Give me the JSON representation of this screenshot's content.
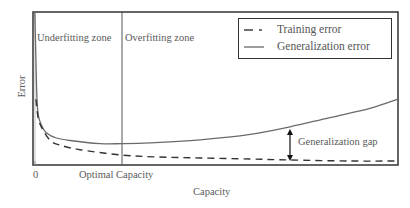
{
  "chart_data": {
    "type": "line",
    "title": "",
    "xlabel": "Capacity",
    "ylabel": "Error",
    "x_ticks": [
      {
        "label": "0",
        "x": 0
      },
      {
        "label": "Optimal Capacity",
        "x": 24.4
      }
    ],
    "xlim": [
      0,
      100
    ],
    "ylim": [
      0,
      10
    ],
    "grid": false,
    "legend_position": "upper right",
    "series": [
      {
        "name": "Training error",
        "style": "dashed",
        "color": "#333333",
        "points": [
          [
            0.8,
            4.3
          ],
          [
            1.4,
            3.1
          ],
          [
            2.5,
            2.4
          ],
          [
            4.7,
            1.6
          ],
          [
            7.4,
            1.3
          ],
          [
            12.9,
            1.0
          ],
          [
            24.4,
            0.65
          ],
          [
            34.8,
            0.52
          ],
          [
            45.8,
            0.46
          ],
          [
            59.5,
            0.39
          ],
          [
            70.4,
            0.33
          ],
          [
            86.8,
            0.26
          ],
          [
            100,
            0.26
          ]
        ]
      },
      {
        "name": "Generalization error",
        "style": "solid",
        "color": "#666666",
        "points": [
          [
            0.5,
            10.0
          ],
          [
            0.8,
            6.9
          ],
          [
            1.1,
            4.3
          ],
          [
            1.6,
            3.1
          ],
          [
            3.3,
            2.2
          ],
          [
            6.0,
            1.8
          ],
          [
            10.1,
            1.6
          ],
          [
            18.4,
            1.4
          ],
          [
            24.4,
            1.4
          ],
          [
            32.1,
            1.45
          ],
          [
            45.8,
            1.65
          ],
          [
            59.5,
            2.0
          ],
          [
            70.4,
            2.5
          ],
          [
            81.4,
            3.1
          ],
          [
            92.3,
            3.7
          ],
          [
            100,
            4.3
          ]
        ]
      }
    ],
    "annotations": [
      {
        "text": "Underfitting zone",
        "x": 1,
        "y": 9.2
      },
      {
        "text": "Overfitting zone",
        "x": 25.5,
        "y": 9.2
      },
      {
        "text": "Generalization gap",
        "x": 70.4,
        "y_from": 0.33,
        "y_to": 2.5,
        "type": "double-arrow"
      }
    ],
    "vertical_lines": [
      {
        "x": 24.4,
        "label": "Optimal Capacity"
      }
    ]
  },
  "labels": {
    "underfitting": "Underfitting zone",
    "overfitting": "Overfitting zone",
    "gap": "Generalization gap",
    "tick_zero": "0",
    "tick_optimal": "Optimal Capacity",
    "xlabel": "Capacity",
    "ylabel": "Error"
  },
  "legend": {
    "items": [
      {
        "label": "Training error",
        "style": "dashed"
      },
      {
        "label": "Generalization error",
        "style": "solid"
      }
    ]
  }
}
